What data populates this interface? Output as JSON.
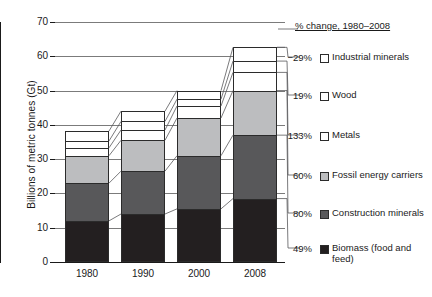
{
  "chart_data": {
    "type": "bar",
    "stacked": true,
    "title": "",
    "xlabel": "",
    "ylabel": "Billions of metric tonnes (Gt)",
    "categories": [
      "1980",
      "1990",
      "2000",
      "2008"
    ],
    "ylim": [
      0,
      70
    ],
    "yticks": [
      0,
      10,
      20,
      30,
      40,
      50,
      60,
      70
    ],
    "grid": "horizontal",
    "legend_position": "right",
    "legend_title": "% change, 1980–2008",
    "series": [
      {
        "name": "Biomass (food and feed)",
        "pct_change": "49%",
        "color": "#231f20",
        "values": [
          12.0,
          14.0,
          15.5,
          18.5
        ]
      },
      {
        "name": "Construction minerals",
        "pct_change": "80%",
        "color": "#58585a",
        "values": [
          11.0,
          12.5,
          15.5,
          18.5
        ]
      },
      {
        "name": "Fossil energy carriers",
        "pct_change": "60%",
        "color": "#bcbdbf",
        "values": [
          8.0,
          9.0,
          11.0,
          13.0
        ]
      },
      {
        "name": "Metals",
        "pct_change": "133%",
        "color": "#ffffff",
        "values": [
          2.3,
          3.0,
          3.5,
          5.3
        ]
      },
      {
        "name": "Wood",
        "pct_change": "19%",
        "color": "#ffffff",
        "values": [
          2.0,
          2.5,
          2.0,
          3.3
        ]
      },
      {
        "name": "Industrial minerals",
        "pct_change": "-29%",
        "color": "#ffffff",
        "values": [
          2.9,
          3.0,
          2.5,
          4.0
        ]
      }
    ],
    "totals": [
      38.2,
      44.0,
      50.0,
      62.6
    ]
  },
  "axis": {
    "y_title": "Billions of metric tonnes (Gt)",
    "y_ticks": [
      "70",
      "60",
      "50",
      "40",
      "30",
      "20",
      "10",
      "0"
    ],
    "x_ticks": [
      "1980",
      "1990",
      "2000",
      "2008"
    ]
  },
  "legend": {
    "header": "% change, 1980–2008",
    "items": [
      {
        "pct": "−29%",
        "label": "Industrial minerals"
      },
      {
        "pct": "19%",
        "label": "Wood"
      },
      {
        "pct": "133%",
        "label": "Metals"
      },
      {
        "pct": "60%",
        "label": "Fossil energy carriers"
      },
      {
        "pct": "80%",
        "label": "Construction minerals"
      },
      {
        "pct": "49%",
        "label": "Biomass (food and feed)"
      }
    ]
  }
}
